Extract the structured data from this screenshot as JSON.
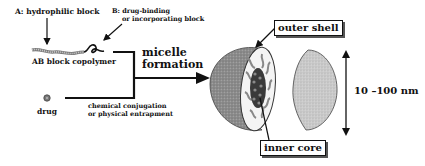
{
  "diagram": {
    "labels": {
      "block_a": "A: hydrophilic block",
      "block_b_line1": "B: drug-binding",
      "block_b_line2": "or incorporating block",
      "copolymer": "AB block copolymer",
      "drug": "drug",
      "process_line1": "micelle",
      "process_line2": "formation",
      "method_line1": "chemical conjugation",
      "method_line2": "or physical entrapment",
      "outer_shell": "outer shell",
      "inner_core": "inner core",
      "size": "10 –100 nm"
    },
    "colors": {
      "line": "#111111",
      "shell": "#8a8a8a",
      "core": "#3a3a3a",
      "cap": "#c8c8c8",
      "chain": "#9a9a9a"
    }
  }
}
